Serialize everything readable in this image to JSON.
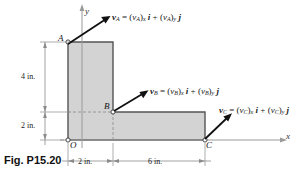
{
  "figure": {
    "caption": "Fig. P15.20",
    "type": "engineering-diagram",
    "points": {
      "A": "A",
      "B": "B",
      "C": "C",
      "O": "O"
    },
    "axes": {
      "x_label": "x",
      "y_label": "y"
    },
    "dimensions": [
      {
        "id": "dim-4in",
        "label": "4 in.",
        "orientation": "vertical"
      },
      {
        "id": "dim-2in-left",
        "label": "2 in.",
        "orientation": "vertical"
      },
      {
        "id": "dim-2in-bottom",
        "label": "2 in.",
        "orientation": "horizontal"
      },
      {
        "id": "dim-6in",
        "label": "6 in.",
        "orientation": "horizontal"
      }
    ],
    "vectors": [
      {
        "id": "vA",
        "symbol": "v",
        "subscript": "A",
        "equation_plain": "vA = (vA)x i + (vA)y j",
        "eq_lhs": "v",
        "eq_lhs_sub": "A",
        "eq_eq": "=",
        "eq_t1_open": "(",
        "eq_t1_v": "v",
        "eq_t1_sub": "A",
        "eq_t1_close": ")",
        "eq_t1_comp": "x",
        "eq_t1_unit": "i",
        "eq_plus": "+",
        "eq_t2_open": "(",
        "eq_t2_v": "v",
        "eq_t2_sub": "A",
        "eq_t2_close": ")",
        "eq_t2_comp": "y",
        "eq_t2_unit": "j"
      },
      {
        "id": "vB",
        "symbol": "v",
        "subscript": "B",
        "equation_plain": "vB = (vB)x i + (vB)y j",
        "eq_lhs": "v",
        "eq_lhs_sub": "B",
        "eq_eq": "=",
        "eq_t1_open": "(",
        "eq_t1_v": "v",
        "eq_t1_sub": "B",
        "eq_t1_close": ")",
        "eq_t1_comp": "x",
        "eq_t1_unit": "i",
        "eq_plus": "+",
        "eq_t2_open": "(",
        "eq_t2_v": "v",
        "eq_t2_sub": "B",
        "eq_t2_close": ")",
        "eq_t2_comp": "y",
        "eq_t2_unit": "j"
      },
      {
        "id": "vC",
        "symbol": "v",
        "subscript": "C",
        "equation_plain": "vC = (vC)x i + (vC)y j",
        "eq_lhs": "v",
        "eq_lhs_sub": "C",
        "eq_eq": "=",
        "eq_t1_open": "(",
        "eq_t1_v": "v",
        "eq_t1_sub": "C",
        "eq_t1_close": ")",
        "eq_t1_comp": "x",
        "eq_t1_unit": "i",
        "eq_plus": "+",
        "eq_t2_open": "(",
        "eq_t2_v": "v",
        "eq_t2_sub": "C",
        "eq_t2_close": ")",
        "eq_t2_comp": "y",
        "eq_t2_unit": "j"
      }
    ],
    "colors": {
      "body_fill": "#d3d3d3",
      "body_stroke": "#555555",
      "axis": "#8a8a8a",
      "vector": "#111111",
      "dimension": "#777777",
      "background": "#ffffff"
    }
  }
}
